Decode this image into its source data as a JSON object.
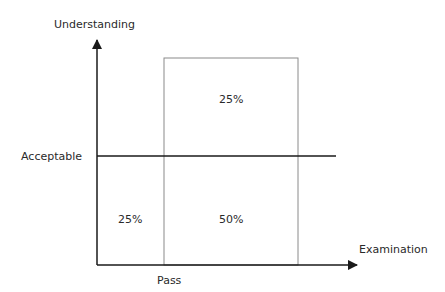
{
  "diagram": {
    "y_axis_label": "Understanding",
    "x_axis_label": "Examination",
    "threshold_label": "Acceptable",
    "x_marker_label": "Pass",
    "regions": {
      "top_right": "25%",
      "bottom_left": "25%",
      "bottom_right": "50%"
    },
    "colors": {
      "axis": "#1a1a1a",
      "box": "#8a8a8a",
      "text": "#2a2a2a"
    }
  }
}
